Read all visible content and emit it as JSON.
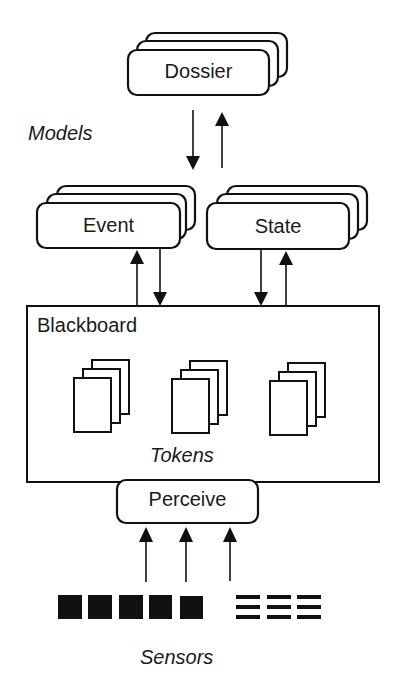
{
  "diagram": {
    "title": "",
    "layers": {
      "models": {
        "label": "Models",
        "dossier": {
          "label": "Dossier"
        }
      },
      "model_types": [
        {
          "label": "Event"
        },
        {
          "label": "State"
        }
      ],
      "blackboard": {
        "label": "Blackboard",
        "tokens_label": "Tokens",
        "token_stacks": 3
      },
      "perceive": {
        "label": "Perceive"
      },
      "sensors": {
        "label": "Sensors",
        "solid_sensors": 5,
        "striped_sensors": 3
      }
    },
    "edges": [
      {
        "from": "Dossier",
        "to": "Models layer (Event/State)",
        "direction": "down"
      },
      {
        "from": "Models layer (Event/State)",
        "to": "Dossier",
        "direction": "up"
      },
      {
        "from": "Blackboard",
        "to": "Event",
        "direction": "up"
      },
      {
        "from": "Event",
        "to": "Blackboard",
        "direction": "down"
      },
      {
        "from": "State",
        "to": "Blackboard",
        "direction": "down"
      },
      {
        "from": "Blackboard",
        "to": "State",
        "direction": "up"
      },
      {
        "from": "Sensors",
        "to": "Perceive",
        "direction": "up",
        "count": 3
      }
    ]
  }
}
